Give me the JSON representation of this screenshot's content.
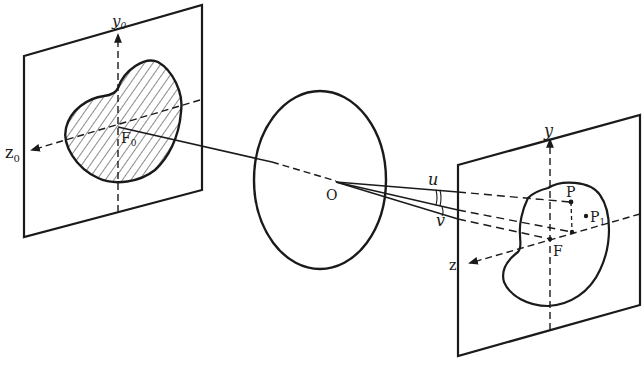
{
  "diagram": {
    "object_plane": {
      "axis_y_label": "y",
      "axis_y_sub": "0",
      "axis_z_label": "z",
      "axis_z_sub": "0",
      "origin_label": "F",
      "origin_sub": "0",
      "shape": "hatched kidney-shaped object"
    },
    "lens": {
      "center_label": "O"
    },
    "angles": {
      "u_label": "u",
      "v_label": "v"
    },
    "image_plane": {
      "axis_y_label": "y",
      "axis_z_label": "z",
      "origin_label": "F",
      "point_p_label": "P",
      "point_p1_label": "P",
      "point_p1_sub": "1",
      "shape": "kidney-shaped image outline"
    },
    "colors": {
      "ink": "#1a1a1a",
      "background": "#ffffff"
    }
  }
}
